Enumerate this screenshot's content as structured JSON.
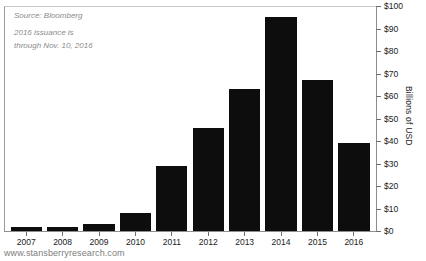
{
  "chart_data": {
    "type": "bar",
    "title": "",
    "xlabel": "",
    "ylabel": "Billions of USD",
    "ylim": [
      0,
      100
    ],
    "ytick_labels": [
      "$100",
      "$90",
      "$80",
      "$70",
      "$60",
      "$50",
      "$40",
      "$30",
      "$20",
      "$10",
      "$0"
    ],
    "ytick_values": [
      100,
      90,
      80,
      70,
      60,
      50,
      40,
      30,
      20,
      10,
      0
    ],
    "grid": false,
    "legend": "none",
    "axis_position": "right",
    "categories": [
      "2007",
      "2008",
      "2009",
      "2010",
      "2011",
      "2012",
      "2013",
      "2014",
      "2015",
      "2016"
    ],
    "values": [
      2,
      2,
      3,
      8,
      29,
      46,
      63,
      95,
      67,
      39
    ],
    "bar_color": "#0d0d0d"
  },
  "annotations": {
    "source": "Source: Bloomberg",
    "note": "2016 issuance is\nthrough Nov. 10, 2016",
    "watermark": "www.stansberryresearch.com"
  }
}
